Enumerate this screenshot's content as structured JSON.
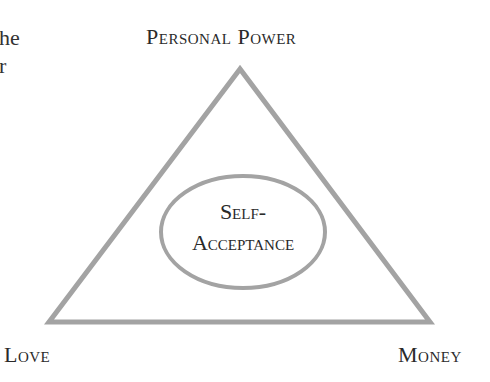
{
  "text_fragment": {
    "line1": "he",
    "line2": "r"
  },
  "diagram": {
    "type": "triangle",
    "vertices": {
      "top": "Personal Power",
      "bottom_left": "Love",
      "bottom_right": "Money"
    },
    "center": {
      "line1": "Self-",
      "line2": "Acceptance"
    },
    "stroke_color": "#a0a0a0"
  }
}
